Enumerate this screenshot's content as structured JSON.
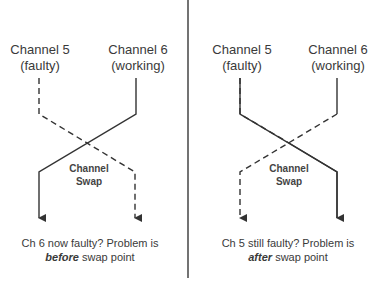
{
  "panels": [
    {
      "channel_a": {
        "name": "Channel 5",
        "status": "(faulty)"
      },
      "channel_b": {
        "name": "Channel 6",
        "status": "(working)"
      },
      "swap_label": {
        "line1": "Channel",
        "line2": "Swap"
      },
      "conclusion": {
        "line1": "Ch 6 now faulty? Problem is",
        "emphasis": "before",
        "rest": " swap point"
      }
    },
    {
      "channel_a": {
        "name": "Channel 5",
        "status": "(faulty)"
      },
      "channel_b": {
        "name": "Channel 6",
        "status": "(working)"
      },
      "swap_label": {
        "line1": "Channel",
        "line2": "Swap"
      },
      "conclusion": {
        "line1": "Ch 5 still faulty? Problem is",
        "emphasis": "after",
        "rest": " swap point"
      }
    }
  ],
  "colors": {
    "line": "#333333",
    "divider": "#444444",
    "text": "#3a3a3a"
  }
}
